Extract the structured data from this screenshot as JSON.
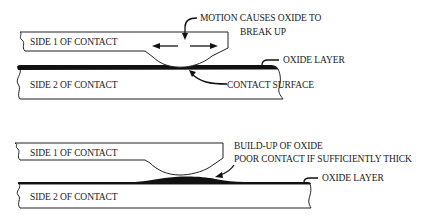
{
  "diagram": {
    "top": {
      "side1_label": "SIDE 1 OF CONTACT",
      "side2_label": "SIDE 2 OF CONTACT",
      "motion_label_line1": "MOTION CAUSES OXIDE TO",
      "motion_label_line2": "BREAK UP",
      "oxide_label": "OXIDE LAYER",
      "contact_surface_label": "CONTACT SURFACE"
    },
    "bottom": {
      "side1_label": "SIDE 1 OF CONTACT",
      "side2_label": "SIDE 2 OF CONTACT",
      "buildup_label_line1": "BUILD-UP OF OXIDE",
      "buildup_label_line2": "POOR CONTACT IF SUFFICIENTLY THICK",
      "oxide_label": "OXIDE LAYER"
    }
  },
  "colors": {
    "line": "#222222",
    "oxide": "#111111",
    "background": "#ffffff"
  }
}
